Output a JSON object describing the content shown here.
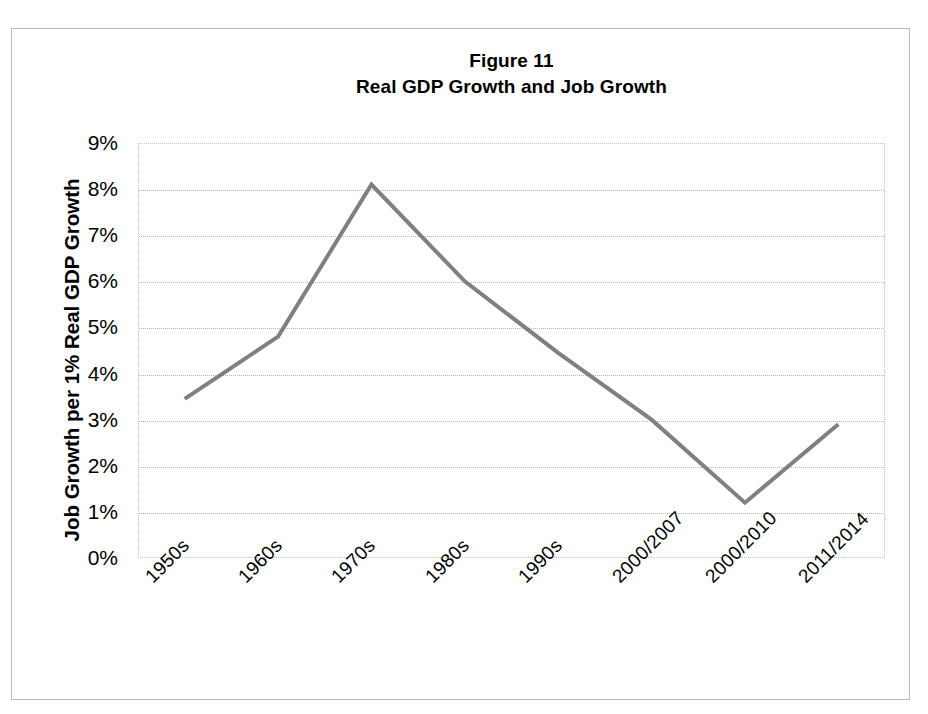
{
  "figure": {
    "title": "Figure 11",
    "subtitle": "Real GDP Growth and Job Growth"
  },
  "axes": {
    "y_title": "Job Growth per 1% Real GDP Growth",
    "y_ticks": [
      "0%",
      "1%",
      "2%",
      "3%",
      "4%",
      "5%",
      "6%",
      "7%",
      "8%",
      "9%"
    ],
    "x_ticks": [
      "1950s",
      "1960s",
      "1970s",
      "1980s",
      "1990s",
      "2000/2007",
      "2000/2010",
      "2011/2014"
    ]
  },
  "style": {
    "line_color": "#808080",
    "grid_color": "#b5b5b5",
    "frame_color": "#b9b9b9",
    "text_color": "#000000"
  },
  "chart_data": {
    "type": "line",
    "xlabel": "",
    "ylabel": "Job Growth per 1% Real GDP Growth",
    "categories": [
      "1950s",
      "1960s",
      "1970s",
      "1980s",
      "1990s",
      "2000/2007",
      "2000/2010",
      "2011/2014"
    ],
    "values": [
      3.45,
      4.8,
      8.1,
      6.0,
      4.45,
      3.0,
      1.2,
      2.9
    ],
    "value_unit": "%",
    "ylim": [
      0,
      9
    ],
    "ytick_step": 1,
    "grid": true,
    "legend": "none",
    "series": [
      {
        "name": "Job Growth per 1% Real GDP Growth",
        "values": [
          3.45,
          4.8,
          8.1,
          6.0,
          4.45,
          3.0,
          1.2,
          2.9
        ]
      }
    ]
  }
}
